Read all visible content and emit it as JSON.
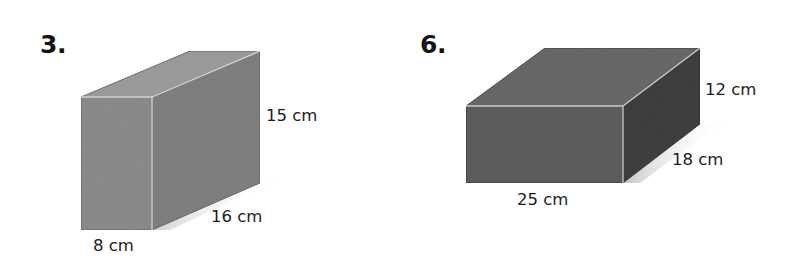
{
  "problems": [
    {
      "number": "3.",
      "shape": "rectangular-prism",
      "dimensions": {
        "height": "15 cm",
        "length": "16 cm",
        "width": "8 cm"
      }
    },
    {
      "number": "6.",
      "shape": "rectangular-prism",
      "dimensions": {
        "height": "12 cm",
        "width": "18 cm",
        "length": "25 cm"
      }
    }
  ],
  "colors": {
    "background": "#ffffff",
    "box3_front": "#8a8a8a",
    "box3_top": "#9a9a9a",
    "box3_side": "#7e7e7e",
    "box6_front": "#5c5c5c",
    "box6_top": "#676767",
    "box6_side": "#3e3e3e",
    "edge_highlight": "#d6d6d6",
    "text": "#1c1c1c"
  }
}
